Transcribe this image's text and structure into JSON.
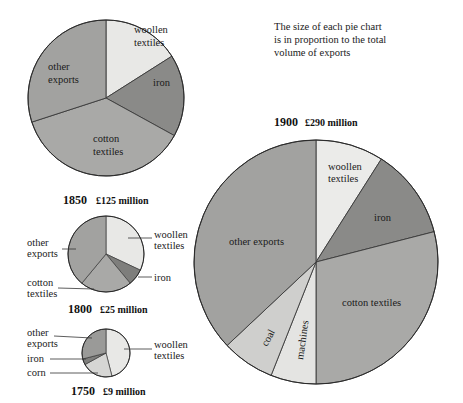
{
  "chart_data": [
    {
      "type": "pie",
      "year": "1850",
      "total": "£125 million",
      "slices": [
        {
          "label": "woollen textiles",
          "value": 16,
          "color": "#e8e8e6"
        },
        {
          "label": "iron",
          "value": 17,
          "color": "#8a8a88"
        },
        {
          "label": "cotton textiles",
          "value": 37,
          "color": "#a9a9a7"
        },
        {
          "label": "other exports",
          "value": 30,
          "color": "#a2a2a0"
        }
      ]
    },
    {
      "type": "pie",
      "year": "1800",
      "total": "£25 million",
      "slices": [
        {
          "label": "woollen textiles",
          "value": 32,
          "color": "#e8e8e6"
        },
        {
          "label": "iron",
          "value": 7,
          "color": "#7e7e7c"
        },
        {
          "label": "cotton textiles",
          "value": 22,
          "color": "#a9a9a7"
        },
        {
          "label": "other exports",
          "value": 39,
          "color": "#a2a2a0"
        }
      ]
    },
    {
      "type": "pie",
      "year": "1750",
      "total": "£9 million",
      "slices": [
        {
          "label": "woollen textiles",
          "value": 46,
          "color": "#e8e8e6"
        },
        {
          "label": "corn",
          "value": 21,
          "color": "#d6d6d4"
        },
        {
          "label": "iron",
          "value": 4,
          "color": "#7e7e7c"
        },
        {
          "label": "other exports",
          "value": 29,
          "color": "#9a9a98"
        }
      ]
    },
    {
      "type": "pie",
      "year": "1900",
      "total": "£290 million",
      "slices": [
        {
          "label": "woollen textiles",
          "value": 9,
          "color": "#ebebe9"
        },
        {
          "label": "iron",
          "value": 12,
          "color": "#8a8a88"
        },
        {
          "label": "cotton textiles",
          "value": 29,
          "color": "#a9a9a7"
        },
        {
          "label": "machines",
          "value": 6,
          "color": "#e4e4e2"
        },
        {
          "label": "coal",
          "value": 7,
          "color": "#cfcfcd"
        },
        {
          "label": "other exports",
          "value": 37,
          "color": "#a2a2a0"
        }
      ]
    }
  ],
  "note": "The size of each pie chart is in proportion to the total volume of exports",
  "note_lines": [
    "The size of each pie chart",
    "is in proportion to the total",
    "volume of exports"
  ]
}
